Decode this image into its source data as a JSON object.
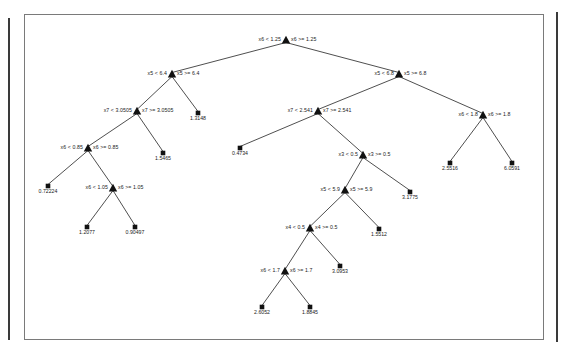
{
  "figure": {
    "title": "",
    "background_color": "#ffffff",
    "frame_color": "#7a7a7a",
    "node_color": "#111111",
    "edge_color": "#222222"
  },
  "chart_data": {
    "type": "diagram",
    "diagram_type": "regression-decision-tree",
    "title": "",
    "xlabel": "",
    "ylabel": "",
    "grid": false,
    "legend": "none",
    "node_marker": "triangle",
    "leaf_marker": "square",
    "split_label_format": "{feature} < {threshold}   {feature} >= {threshold}",
    "nodes": [
      {
        "id": "n0",
        "kind": "split",
        "feature": "x6",
        "threshold": "1.25",
        "left_label": "x6 < 1.25",
        "right_label": "x6 >= 1.25",
        "x": 286,
        "y": 40,
        "depth": 0
      },
      {
        "id": "n1",
        "kind": "split",
        "feature": "x5",
        "threshold": "6.4",
        "left_label": "x5 < 6.4",
        "right_label": "x5 >= 6.4",
        "x": 172,
        "y": 74,
        "depth": 1
      },
      {
        "id": "n2",
        "kind": "split",
        "feature": "x5",
        "threshold": "6.8",
        "left_label": "x5 < 6.8",
        "right_label": "x5 >= 6.8",
        "x": 399,
        "y": 74,
        "depth": 1
      },
      {
        "id": "n3",
        "kind": "split",
        "feature": "x7",
        "threshold": "3.0505",
        "left_label": "x7 < 3.0505",
        "right_label": "x7 >= 3.0505",
        "x": 137,
        "y": 111,
        "depth": 2
      },
      {
        "id": "l1",
        "kind": "leaf",
        "value": "1.3148",
        "x": 198,
        "y": 113,
        "depth": 2
      },
      {
        "id": "n4",
        "kind": "split",
        "feature": "x7",
        "threshold": "2.541",
        "left_label": "x7 < 2.541",
        "right_label": "x7 >= 2.541",
        "x": 318,
        "y": 111,
        "depth": 2
      },
      {
        "id": "n5",
        "kind": "split",
        "feature": "x6",
        "threshold": "1.8",
        "left_label": "x6 < 1.8",
        "right_label": "x6 >= 1.8",
        "x": 483,
        "y": 115,
        "depth": 2
      },
      {
        "id": "n6",
        "kind": "split",
        "feature": "x6",
        "threshold": "0.85",
        "left_label": "x6 < 0.85",
        "right_label": "x6 >= 0.85",
        "x": 88,
        "y": 148,
        "depth": 3
      },
      {
        "id": "l2",
        "kind": "leaf",
        "value": "1.5465",
        "x": 163,
        "y": 153,
        "depth": 3
      },
      {
        "id": "l3",
        "kind": "leaf",
        "value": "0.4734",
        "x": 240,
        "y": 148,
        "depth": 3
      },
      {
        "id": "n7",
        "kind": "split",
        "feature": "x3",
        "threshold": "0.5",
        "left_label": "x3 < 0.5",
        "right_label": "x3 >= 0.5",
        "x": 363,
        "y": 155,
        "depth": 3
      },
      {
        "id": "l4",
        "kind": "leaf",
        "value": "2.5516",
        "x": 450,
        "y": 163,
        "depth": 3
      },
      {
        "id": "l5",
        "kind": "leaf",
        "value": "6.0591",
        "x": 512,
        "y": 163,
        "depth": 3
      },
      {
        "id": "l6",
        "kind": "leaf",
        "value": "0.72224",
        "x": 48,
        "y": 186,
        "depth": 4
      },
      {
        "id": "n8",
        "kind": "split",
        "feature": "x6",
        "threshold": "1.05",
        "left_label": "x6 < 1.05",
        "right_label": "x6 >= 1.05",
        "x": 113,
        "y": 188,
        "depth": 4
      },
      {
        "id": "n9",
        "kind": "split",
        "feature": "x5",
        "threshold": "5.9",
        "left_label": "x5 < 5.9",
        "right_label": "x5 >= 5.9",
        "x": 345,
        "y": 190,
        "depth": 4
      },
      {
        "id": "l7",
        "kind": "leaf",
        "value": "3.1775",
        "x": 410,
        "y": 192,
        "depth": 4
      },
      {
        "id": "l8",
        "kind": "leaf",
        "value": "1.2077",
        "x": 87,
        "y": 227,
        "depth": 5
      },
      {
        "id": "l9",
        "kind": "leaf",
        "value": "0.90497",
        "x": 135,
        "y": 227,
        "depth": 5
      },
      {
        "id": "n10",
        "kind": "split",
        "feature": "x4",
        "threshold": "0.5",
        "left_label": "x4 < 0.5",
        "right_label": "x4 >= 0.5",
        "x": 310,
        "y": 228,
        "depth": 5
      },
      {
        "id": "l10",
        "kind": "leaf",
        "value": "1.5512",
        "x": 379,
        "y": 229,
        "depth": 5
      },
      {
        "id": "n11",
        "kind": "split",
        "feature": "x6",
        "threshold": "1.7",
        "left_label": "x6 < 1.7",
        "right_label": "x6 >= 1.7",
        "x": 285,
        "y": 271,
        "depth": 6
      },
      {
        "id": "l11",
        "kind": "leaf",
        "value": "3.0953",
        "x": 340,
        "y": 266,
        "depth": 6
      },
      {
        "id": "l12",
        "kind": "leaf",
        "value": "2.6052",
        "x": 262,
        "y": 307,
        "depth": 7
      },
      {
        "id": "l13",
        "kind": "leaf",
        "value": "1.8845",
        "x": 310,
        "y": 307,
        "depth": 7
      }
    ],
    "edges": [
      {
        "from": "n0",
        "to": "n1",
        "branch": "left"
      },
      {
        "from": "n0",
        "to": "n2",
        "branch": "right"
      },
      {
        "from": "n1",
        "to": "n3",
        "branch": "left"
      },
      {
        "from": "n1",
        "to": "l1",
        "branch": "right"
      },
      {
        "from": "n2",
        "to": "n4",
        "branch": "left"
      },
      {
        "from": "n2",
        "to": "n5",
        "branch": "right"
      },
      {
        "from": "n3",
        "to": "n6",
        "branch": "left"
      },
      {
        "from": "n3",
        "to": "l2",
        "branch": "right"
      },
      {
        "from": "n4",
        "to": "l3",
        "branch": "left"
      },
      {
        "from": "n4",
        "to": "n7",
        "branch": "right"
      },
      {
        "from": "n5",
        "to": "l4",
        "branch": "left"
      },
      {
        "from": "n5",
        "to": "l5",
        "branch": "right"
      },
      {
        "from": "n6",
        "to": "l6",
        "branch": "left"
      },
      {
        "from": "n6",
        "to": "n8",
        "branch": "right"
      },
      {
        "from": "n7",
        "to": "n9",
        "branch": "left"
      },
      {
        "from": "n7",
        "to": "l7",
        "branch": "right"
      },
      {
        "from": "n8",
        "to": "l8",
        "branch": "left"
      },
      {
        "from": "n8",
        "to": "l9",
        "branch": "right"
      },
      {
        "from": "n9",
        "to": "n10",
        "branch": "left"
      },
      {
        "from": "n9",
        "to": "l10",
        "branch": "right"
      },
      {
        "from": "n10",
        "to": "n11",
        "branch": "left"
      },
      {
        "from": "n10",
        "to": "l11",
        "branch": "right"
      },
      {
        "from": "n11",
        "to": "l12",
        "branch": "left"
      },
      {
        "from": "n11",
        "to": "l13",
        "branch": "right"
      }
    ]
  }
}
